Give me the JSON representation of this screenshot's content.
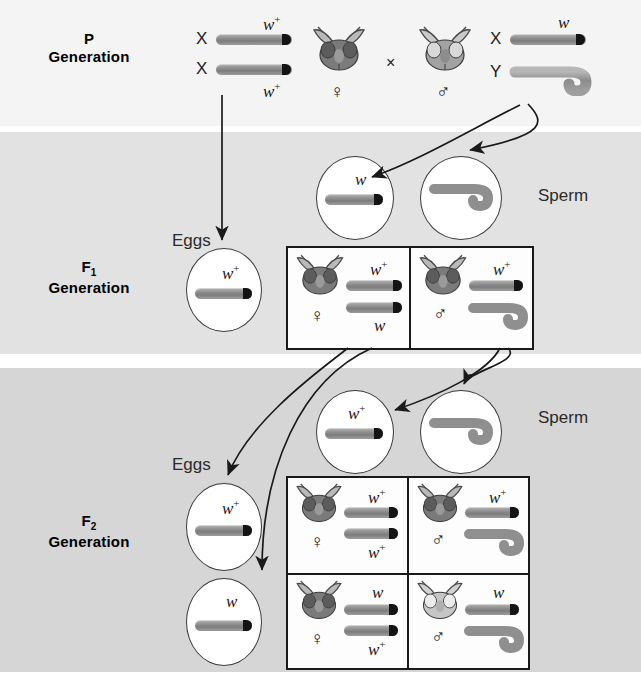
{
  "figure": {
    "bands": [
      {
        "id": "p",
        "label_line1": "P",
        "label_sub": "",
        "label_line2": "Generation",
        "color": "#f4f4f4"
      },
      {
        "id": "f1",
        "label_line1": "F",
        "label_sub": "1",
        "label_line2": "Generation",
        "color": "#e2e2e2"
      },
      {
        "id": "f2",
        "label_line1": "F",
        "label_sub": "2",
        "label_line2": "Generation",
        "color": "#d6d6d6"
      }
    ]
  },
  "labels": {
    "sperm": "Sperm",
    "eggs": "Eggs",
    "cross": "×",
    "female_symbol": "♀",
    "male_symbol": "♂",
    "allele_wildtype": "w",
    "allele_wildtype_sup": "+",
    "allele_white": "w",
    "chrom_x": "X",
    "chrom_y": "Y"
  },
  "p_generation": {
    "female": {
      "sex_symbol": "♀",
      "chromosomes": [
        {
          "type": "X",
          "letter": "X",
          "allele": "w",
          "sup": "+",
          "allele_position": "above"
        },
        {
          "type": "X",
          "letter": "X",
          "allele": "w",
          "sup": "+",
          "allele_position": "below"
        }
      ],
      "phenotype": "red-eyed female"
    },
    "male": {
      "sex_symbol": "♂",
      "chromosomes": [
        {
          "type": "X",
          "letter": "X",
          "allele": "w",
          "sup": "",
          "allele_position": "above"
        },
        {
          "type": "Y",
          "letter": "Y",
          "allele": "",
          "sup": "",
          "allele_position": "none"
        }
      ],
      "phenotype": "white-eyed male"
    },
    "cross_symbol": "×"
  },
  "f1_generation": {
    "eggs_label": "Eggs",
    "sperm_label": "Sperm",
    "eggs": [
      {
        "allele": "w",
        "sup": "+",
        "chrom": "X"
      }
    ],
    "sperm": [
      {
        "allele": "w",
        "sup": "",
        "chrom": "X"
      },
      {
        "allele": "",
        "sup": "",
        "chrom": "Y"
      }
    ],
    "offspring": [
      {
        "sex_symbol": "♀",
        "eye": "red",
        "alleles": [
          {
            "allele": "w",
            "sup": "+",
            "pos": "above"
          },
          {
            "allele": "w",
            "sup": "",
            "pos": "below"
          }
        ],
        "chroms": [
          "X",
          "X"
        ]
      },
      {
        "sex_symbol": "♂",
        "eye": "red",
        "alleles": [
          {
            "allele": "w",
            "sup": "+",
            "pos": "above"
          }
        ],
        "chroms": [
          "X",
          "Y"
        ]
      }
    ]
  },
  "f2_generation": {
    "eggs_label": "Eggs",
    "sperm_label": "Sperm",
    "eggs": [
      {
        "allele": "w",
        "sup": "+",
        "chrom": "X"
      },
      {
        "allele": "w",
        "sup": "",
        "chrom": "X"
      }
    ],
    "sperm": [
      {
        "allele": "w",
        "sup": "+",
        "chrom": "X"
      },
      {
        "allele": "",
        "sup": "",
        "chrom": "Y"
      }
    ],
    "offspring": [
      {
        "cell": "top-left",
        "sex_symbol": "♀",
        "eye": "red",
        "alleles": [
          {
            "allele": "w",
            "sup": "+",
            "pos": "above"
          },
          {
            "allele": "w",
            "sup": "+",
            "pos": "below"
          }
        ],
        "chroms": [
          "X",
          "X"
        ]
      },
      {
        "cell": "top-right",
        "sex_symbol": "♂",
        "eye": "red",
        "alleles": [
          {
            "allele": "w",
            "sup": "+",
            "pos": "above"
          }
        ],
        "chroms": [
          "X",
          "Y"
        ]
      },
      {
        "cell": "bottom-left",
        "sex_symbol": "♀",
        "eye": "red",
        "alleles": [
          {
            "allele": "w",
            "sup": "",
            "pos": "above"
          },
          {
            "allele": "w",
            "sup": "+",
            "pos": "below"
          }
        ],
        "chroms": [
          "X",
          "X"
        ]
      },
      {
        "cell": "bottom-right",
        "sex_symbol": "♂",
        "eye": "white",
        "alleles": [
          {
            "allele": "w",
            "sup": "",
            "pos": "above"
          }
        ],
        "chroms": [
          "X",
          "Y"
        ]
      }
    ]
  },
  "colors": {
    "band_p": "#f4f4f4",
    "band_f1": "#e2e2e2",
    "band_f2": "#d6d6d6",
    "chromosome_body": "#8f8f8f",
    "chromosome_tip": "#141414",
    "line": "#1a1a1a",
    "fly_red_eye": "#6e6e6e",
    "fly_white_eye": "#dcdcdc"
  }
}
